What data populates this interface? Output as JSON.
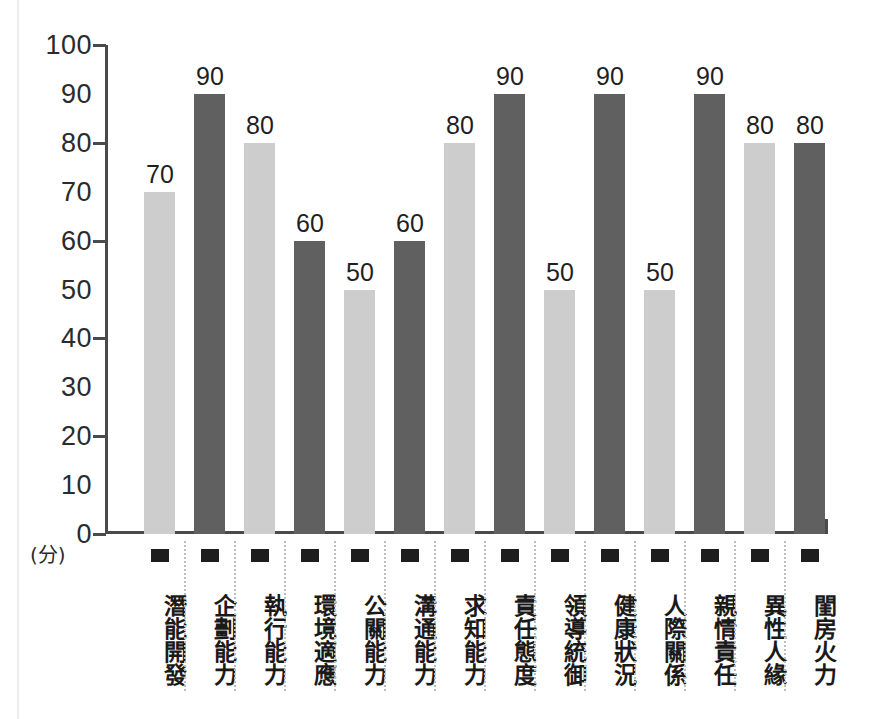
{
  "chart_data": {
    "type": "bar",
    "title": "",
    "subtitle": "",
    "xlabel": "",
    "ylabel": "(分)",
    "ylim": [
      0,
      100
    ],
    "grid": false,
    "legend": "none",
    "tick_labels_y": [
      "100",
      "90",
      "80",
      "70",
      "60",
      "50",
      "40",
      "30",
      "20",
      "10",
      "0"
    ],
    "major_ticks_y": [
      100,
      80,
      60,
      40,
      20,
      0
    ],
    "categories": [
      "潛能開發",
      "企劃能力",
      "執行能力",
      "環境適應",
      "公關能力",
      "溝通能力",
      "求知能力",
      "責任態度",
      "領導統御",
      "健康狀況",
      "人際關係",
      "親情責任",
      "異性人緣",
      "閨房火力"
    ],
    "values": [
      70,
      90,
      80,
      60,
      50,
      60,
      80,
      90,
      50,
      90,
      50,
      90,
      80,
      80
    ],
    "bar_colors": [
      "light",
      "dark",
      "light",
      "dark",
      "light",
      "dark",
      "light",
      "dark",
      "light",
      "dark",
      "light",
      "dark",
      "light",
      "dark"
    ],
    "value_labels": [
      "70",
      "90",
      "80",
      "60",
      "50",
      "60",
      "80",
      "90",
      "50",
      "90",
      "50",
      "90",
      "80",
      "80"
    ],
    "colors": {
      "light_bar": "#cdcdcd",
      "dark_bar": "#606060",
      "axis": "#4a4a4a",
      "text": "#1f1f1f",
      "separator": "#bdbdbd",
      "marker": "#1d1d1d",
      "background": "#ffffff"
    }
  }
}
